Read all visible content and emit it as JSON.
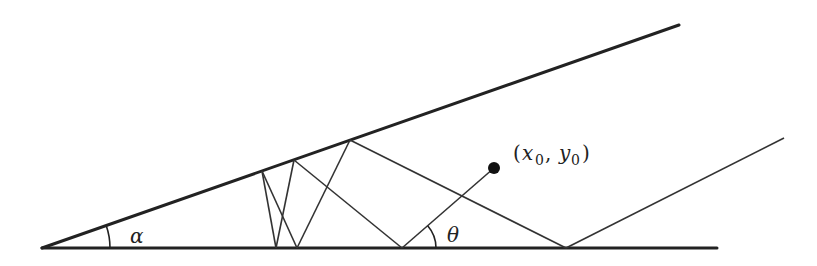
{
  "diagram": {
    "type": "wedge-reflection",
    "colors": {
      "stroke": "#222222",
      "background": "#ffffff"
    },
    "wedge": {
      "apex": [
        42,
        248
      ],
      "bottom_end": [
        717,
        248
      ],
      "top_end": [
        679,
        25
      ],
      "stroke_width": 3
    },
    "reflections": [
      {
        "from": [
          262,
          171
        ],
        "to": [
          276,
          248
        ]
      },
      {
        "from": [
          262,
          171
        ],
        "to": [
          297,
          248
        ]
      },
      {
        "from": [
          294,
          160
        ],
        "to": [
          276,
          248
        ]
      },
      {
        "from": [
          294,
          160
        ],
        "to": [
          402,
          248
        ]
      },
      {
        "from": [
          350,
          140
        ],
        "to": [
          297,
          248
        ]
      },
      {
        "from": [
          350,
          140
        ],
        "to": [
          566,
          248
        ]
      },
      {
        "from": [
          402,
          248
        ],
        "to": [
          494,
          168
        ]
      },
      {
        "from": [
          566,
          248
        ],
        "to": [
          784,
          138
        ]
      }
    ],
    "point": {
      "center": [
        494,
        168
      ],
      "radius": 6
    },
    "labels": {
      "alpha": "α",
      "theta": "θ",
      "point_open": "(",
      "point_x": "x",
      "point_x_sub": "0",
      "point_sep": ", ",
      "point_y": "y",
      "point_y_sub": "0",
      "point_close": ")"
    }
  }
}
